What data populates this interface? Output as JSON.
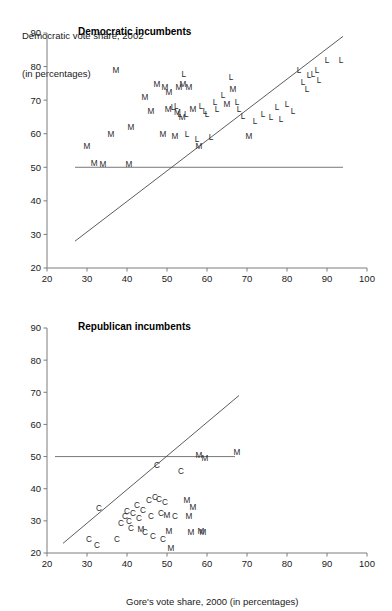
{
  "figure": {
    "ylabel_line1": "Democratic vote share, 2002",
    "ylabel_line2": "(in percentages)",
    "xlabel": "Gore's vote share, 2000 (in percentages)"
  },
  "chart_data": [
    {
      "type": "scatter",
      "title": "Democratic incumbents",
      "xlabel": "Gore's vote share, 2000 (in percentages)",
      "ylabel": "Democratic vote share, 2002 (in percentages)",
      "xlim": [
        20,
        100
      ],
      "ylim": [
        20,
        90
      ],
      "xticks": [
        20,
        30,
        40,
        50,
        60,
        70,
        80,
        90,
        100
      ],
      "yticks": [
        20,
        30,
        40,
        50,
        60,
        70,
        80,
        90
      ],
      "grid": false,
      "legend": "none",
      "reference_line_y": 50,
      "reference_line_x_range": [
        27,
        94
      ],
      "fit_line": {
        "x": [
          27,
          94
        ],
        "y": [
          28,
          89
        ]
      },
      "point_marker_legend": {
        "M": "midterm / uncontested marker",
        "L": "landslide marker"
      },
      "points": [
        {
          "x": 30.0,
          "y": 55.5,
          "label": "M"
        },
        {
          "x": 31.8,
          "y": 50.3,
          "label": "M"
        },
        {
          "x": 34.0,
          "y": 50.0,
          "label": "M"
        },
        {
          "x": 37.2,
          "y": 78.0,
          "label": "M"
        },
        {
          "x": 36.0,
          "y": 59.0,
          "label": "M"
        },
        {
          "x": 40.5,
          "y": 50.2,
          "label": "M"
        },
        {
          "x": 41.0,
          "y": 61.0,
          "label": "M"
        },
        {
          "x": 44.5,
          "y": 70.0,
          "label": "M"
        },
        {
          "x": 46.0,
          "y": 66.0,
          "label": "M"
        },
        {
          "x": 47.5,
          "y": 74.0,
          "label": "M"
        },
        {
          "x": 49.0,
          "y": 59.0,
          "label": "M"
        },
        {
          "x": 49.5,
          "y": 73.0,
          "label": "M"
        },
        {
          "x": 50.5,
          "y": 71.5,
          "label": "M"
        },
        {
          "x": 50.3,
          "y": 66.5,
          "label": "M"
        },
        {
          "x": 51.5,
          "y": 67.0,
          "label": "L"
        },
        {
          "x": 52.3,
          "y": 67.5,
          "label": "L"
        },
        {
          "x": 52.6,
          "y": 65.5,
          "label": "M"
        },
        {
          "x": 53.0,
          "y": 73.0,
          "label": "M"
        },
        {
          "x": 53.2,
          "y": 65.0,
          "label": "L"
        },
        {
          "x": 53.8,
          "y": 64.0,
          "label": "M"
        },
        {
          "x": 54.2,
          "y": 77.0,
          "label": "L"
        },
        {
          "x": 54.0,
          "y": 74.0,
          "label": "M"
        },
        {
          "x": 54.8,
          "y": 65.0,
          "label": "L"
        },
        {
          "x": 55.5,
          "y": 73.0,
          "label": "M"
        },
        {
          "x": 55.0,
          "y": 59.0,
          "label": "L"
        },
        {
          "x": 52.0,
          "y": 58.5,
          "label": "M"
        },
        {
          "x": 56.5,
          "y": 66.5,
          "label": "M"
        },
        {
          "x": 57.5,
          "y": 57.5,
          "label": "L"
        },
        {
          "x": 58.0,
          "y": 55.5,
          "label": "M"
        },
        {
          "x": 58.5,
          "y": 67.5,
          "label": "L"
        },
        {
          "x": 59.5,
          "y": 66.0,
          "label": "L"
        },
        {
          "x": 60.0,
          "y": 65.0,
          "label": "L"
        },
        {
          "x": 61.0,
          "y": 58.0,
          "label": "L"
        },
        {
          "x": 62.0,
          "y": 68.5,
          "label": "L"
        },
        {
          "x": 62.5,
          "y": 66.5,
          "label": "L"
        },
        {
          "x": 64.0,
          "y": 70.5,
          "label": "L"
        },
        {
          "x": 65.0,
          "y": 68.0,
          "label": "M"
        },
        {
          "x": 66.0,
          "y": 76.0,
          "label": "L"
        },
        {
          "x": 66.5,
          "y": 72.5,
          "label": "M"
        },
        {
          "x": 67.5,
          "y": 68.5,
          "label": "L"
        },
        {
          "x": 68.0,
          "y": 66.5,
          "label": "L"
        },
        {
          "x": 69.0,
          "y": 64.5,
          "label": "L"
        },
        {
          "x": 70.5,
          "y": 58.5,
          "label": "M"
        },
        {
          "x": 72.0,
          "y": 63.0,
          "label": "L"
        },
        {
          "x": 74.0,
          "y": 65.0,
          "label": "L"
        },
        {
          "x": 76.0,
          "y": 64.0,
          "label": "L"
        },
        {
          "x": 77.5,
          "y": 67.0,
          "label": "L"
        },
        {
          "x": 78.5,
          "y": 63.5,
          "label": "L"
        },
        {
          "x": 80.0,
          "y": 68.0,
          "label": "L"
        },
        {
          "x": 81.5,
          "y": 66.0,
          "label": "L"
        },
        {
          "x": 83.0,
          "y": 78.0,
          "label": "L"
        },
        {
          "x": 84.0,
          "y": 74.5,
          "label": "L"
        },
        {
          "x": 85.0,
          "y": 72.5,
          "label": "L"
        },
        {
          "x": 85.5,
          "y": 76.5,
          "label": "L"
        },
        {
          "x": 86.5,
          "y": 77.0,
          "label": "L"
        },
        {
          "x": 87.5,
          "y": 78.0,
          "label": "L"
        },
        {
          "x": 88.0,
          "y": 75.0,
          "label": "L"
        },
        {
          "x": 90.0,
          "y": 81.0,
          "label": "L"
        },
        {
          "x": 93.5,
          "y": 81.0,
          "label": "L"
        }
      ]
    },
    {
      "type": "scatter",
      "title": "Republican incumbents",
      "xlabel": "Gore's vote share, 2000 (in percentages)",
      "ylabel": "Democratic vote share, 2002 (in percentages)",
      "xlim": [
        20,
        100
      ],
      "ylim": [
        20,
        90
      ],
      "xticks": [
        20,
        30,
        40,
        50,
        60,
        70,
        80,
        90,
        100
      ],
      "yticks": [
        20,
        30,
        40,
        50,
        60,
        70,
        80,
        90
      ],
      "grid": false,
      "legend": "none",
      "reference_line_y": 50,
      "reference_line_x_range": [
        22,
        67
      ],
      "fit_line": {
        "x": [
          24,
          68
        ],
        "y": [
          23,
          69
        ]
      },
      "point_marker_legend": {
        "C": "contested marker",
        "M": "midterm / uncontested marker"
      },
      "points": [
        {
          "x": 30.5,
          "y": 23.5,
          "label": "C"
        },
        {
          "x": 32.5,
          "y": 21.5,
          "label": "C"
        },
        {
          "x": 33.0,
          "y": 33.0,
          "label": "C"
        },
        {
          "x": 37.5,
          "y": 23.5,
          "label": "C"
        },
        {
          "x": 38.5,
          "y": 28.5,
          "label": "C"
        },
        {
          "x": 39.5,
          "y": 30.5,
          "label": "C"
        },
        {
          "x": 40.5,
          "y": 29.0,
          "label": "C"
        },
        {
          "x": 40.0,
          "y": 32.0,
          "label": "C"
        },
        {
          "x": 41.5,
          "y": 31.5,
          "label": "C"
        },
        {
          "x": 41.0,
          "y": 27.0,
          "label": "C"
        },
        {
          "x": 42.5,
          "y": 34.0,
          "label": "C"
        },
        {
          "x": 43.0,
          "y": 30.0,
          "label": "C"
        },
        {
          "x": 43.5,
          "y": 26.5,
          "label": "M"
        },
        {
          "x": 44.0,
          "y": 32.5,
          "label": "C"
        },
        {
          "x": 44.5,
          "y": 25.5,
          "label": "C"
        },
        {
          "x": 45.5,
          "y": 35.5,
          "label": "C"
        },
        {
          "x": 46.0,
          "y": 30.5,
          "label": "C"
        },
        {
          "x": 46.5,
          "y": 24.5,
          "label": "C"
        },
        {
          "x": 47.0,
          "y": 36.5,
          "label": "C"
        },
        {
          "x": 48.0,
          "y": 36.0,
          "label": "C"
        },
        {
          "x": 47.5,
          "y": 46.5,
          "label": "C"
        },
        {
          "x": 48.5,
          "y": 31.5,
          "label": "C"
        },
        {
          "x": 49.5,
          "y": 35.0,
          "label": "C"
        },
        {
          "x": 49.0,
          "y": 23.5,
          "label": "C"
        },
        {
          "x": 50.0,
          "y": 31.0,
          "label": "M"
        },
        {
          "x": 50.5,
          "y": 26.0,
          "label": "M"
        },
        {
          "x": 51.0,
          "y": 20.5,
          "label": "M"
        },
        {
          "x": 52.0,
          "y": 30.5,
          "label": "C"
        },
        {
          "x": 53.5,
          "y": 44.5,
          "label": "C"
        },
        {
          "x": 55.0,
          "y": 35.5,
          "label": "M"
        },
        {
          "x": 56.5,
          "y": 33.5,
          "label": "M"
        },
        {
          "x": 55.5,
          "y": 30.5,
          "label": "M"
        },
        {
          "x": 56.0,
          "y": 25.5,
          "label": "M"
        },
        {
          "x": 58.5,
          "y": 26.0,
          "label": "M"
        },
        {
          "x": 59.0,
          "y": 25.5,
          "label": "M"
        },
        {
          "x": 58.0,
          "y": 49.5,
          "label": "M"
        },
        {
          "x": 59.5,
          "y": 48.5,
          "label": "M"
        },
        {
          "x": 67.5,
          "y": 50.5,
          "label": "M"
        }
      ]
    }
  ]
}
